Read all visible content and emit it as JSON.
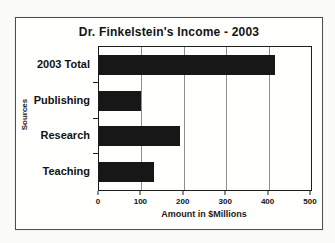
{
  "chart_data": {
    "type": "bar",
    "orientation": "horizontal",
    "title": "Dr. Finkelstein's Income - 2003",
    "categories": [
      "2003 Total",
      "Publishing",
      "Research",
      "Teaching"
    ],
    "values": [
      415,
      100,
      190,
      130
    ],
    "xlabel": "Amount in $Millions",
    "ylabel": "Sources",
    "xlim": [
      0,
      500
    ],
    "xticks": [
      0,
      100,
      200,
      300,
      400,
      500
    ],
    "grid": true,
    "legend": "none",
    "bar_color": "#171717",
    "gridline_color": "#8f8f8f"
  }
}
